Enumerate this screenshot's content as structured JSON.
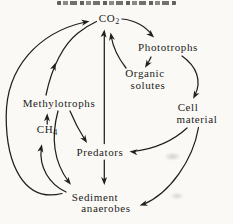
{
  "colors": {
    "paper": "#faf9f5",
    "ink": "#1f1f1f"
  },
  "artifacts": {
    "clipped_heading_at_top_edge": true,
    "heading_legible": false,
    "scan_smudges": 2
  },
  "diagram": {
    "title": "",
    "nodes": {
      "co2": {
        "text": "CO",
        "sub": "2"
      },
      "phototrophs": {
        "label": "Phototrophs"
      },
      "organic_solutes": {
        "line1": "Organic",
        "line2": "solutes"
      },
      "cell_material": {
        "line1": "Cell",
        "line2": "material"
      },
      "methylotrophs": {
        "label": "Methylotrophs"
      },
      "ch4": {
        "text": "CH",
        "sub": "4"
      },
      "predators": {
        "label": "Predators"
      },
      "sediment_anaerobes": {
        "line1": "Sediment",
        "line2": "anaerobes"
      }
    },
    "edges": [
      {
        "id": "co2-to-phototrophs",
        "from": "CO2",
        "to": "Phototrophs"
      },
      {
        "id": "phototrophs-to-organic-solutes",
        "from": "Phototrophs",
        "to": "Organic solutes"
      },
      {
        "id": "organic-solutes-to-co2",
        "from": "Organic solutes",
        "to": "CO2"
      },
      {
        "id": "phototrophs-to-cell-material",
        "from": "Phototrophs",
        "to": "Cell material"
      },
      {
        "id": "cell-material-to-predators",
        "from": "Cell material",
        "to": "Predators"
      },
      {
        "id": "cell-material-to-sediment-anaerobes",
        "from": "Cell material",
        "to": "Sediment anaerobes"
      },
      {
        "id": "predators-to-co2",
        "from": "Predators",
        "to": "CO2"
      },
      {
        "id": "predators-to-sediment-anaerobes",
        "from": "Predators",
        "to": "Sediment anaerobes"
      },
      {
        "id": "methylotrophs-to-co2",
        "from": "Methylotrophs",
        "to": "CO2"
      },
      {
        "id": "methylotrophs-to-predators",
        "from": "Methylotrophs",
        "to": "Predators"
      },
      {
        "id": "methylotrophs-to-sediment-anaerobes",
        "from": "Methylotrophs",
        "to": "Sediment anaerobes"
      },
      {
        "id": "ch4-to-methylotrophs",
        "from": "CH4",
        "to": "Methylotrophs"
      },
      {
        "id": "sediment-anaerobes-to-ch4",
        "from": "Sediment anaerobes",
        "to": "CH4"
      },
      {
        "id": "sediment-anaerobes-to-co2",
        "from": "Sediment anaerobes",
        "to": "CO2"
      }
    ]
  }
}
